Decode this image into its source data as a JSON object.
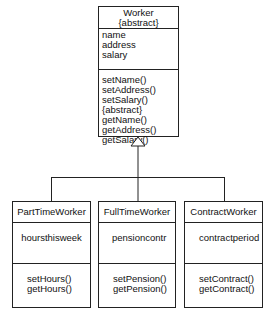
{
  "diagram": {
    "type": "uml-class-diagram",
    "superclass": {
      "name": "Worker",
      "stereotype": "{abstract}",
      "attributes": [
        "name",
        "address",
        "salary"
      ],
      "operations": [
        "setName()",
        "setAddress()",
        "setSalary(){abstract}",
        "getName()",
        "getAddress()",
        "getSalary()"
      ]
    },
    "relationship": "generalization",
    "subclasses": [
      {
        "name": "PartTimeWorker",
        "attributes": [
          "hoursthisweek"
        ],
        "operations": [
          "setHours()",
          "getHours()"
        ]
      },
      {
        "name": "FullTimeWorker",
        "attributes": [
          "pensioncontr"
        ],
        "operations": [
          "setPension()",
          "getPension()"
        ]
      },
      {
        "name": "ContractWorker",
        "attributes": [
          "contractperiod"
        ],
        "operations": [
          "setContract()",
          "getContract()"
        ]
      }
    ]
  }
}
